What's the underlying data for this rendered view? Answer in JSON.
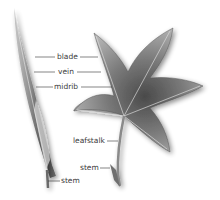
{
  "figure": {
    "labels": {
      "blade": "blade",
      "vein": "vein",
      "midrib": "midrib",
      "leafstalk": "leafstalk",
      "stem_right": "stem",
      "stem_left": "stem"
    },
    "illustrations": [
      {
        "name": "grass-leaf",
        "description": "narrow grass-like leaf with sheath wrapping stem"
      },
      {
        "name": "maple-leaf",
        "description": "five-lobed star-shaped leaf with leafstalk"
      }
    ]
  }
}
